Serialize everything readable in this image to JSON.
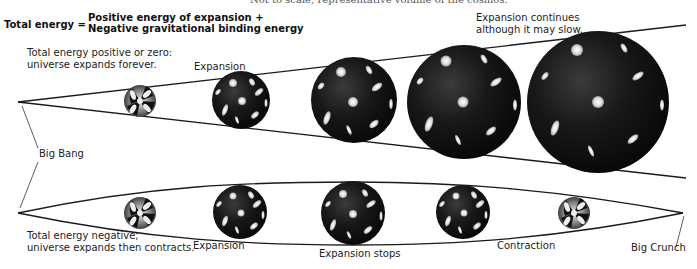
{
  "caption_fragment": "Not to scale; representative volume of the cosmos.",
  "equation": {
    "lhs": "Total energy =",
    "rhs_line1": "Positive energy of expansion +",
    "rhs_line2": "Negative gravitational binding energy"
  },
  "top_scenario": {
    "description_line1": "Total energy positive or zero:",
    "description_line2": "universe expands forever.",
    "stage_labels": {
      "expansion": "Expansion",
      "continues_line1": "Expansion continues",
      "continues_line2": "although it may slow."
    },
    "spheres": [
      {
        "cx": 140,
        "cy": 101,
        "r": 16,
        "style": "early"
      },
      {
        "cx": 241,
        "cy": 100,
        "r": 29,
        "style": "dark"
      },
      {
        "cx": 354,
        "cy": 100,
        "r": 43,
        "style": "dark"
      },
      {
        "cx": 464,
        "cy": 102,
        "r": 57,
        "style": "dark"
      },
      {
        "cx": 598,
        "cy": 102,
        "r": 71,
        "style": "dark"
      }
    ]
  },
  "bottom_scenario": {
    "description_line1": "Total energy negative;",
    "description_line2": "universe expands then contracts.",
    "stage_labels": {
      "expansion": "Expansion",
      "expansion_stops": "Expansion stops",
      "contraction": "Contraction",
      "big_crunch": "Big Crunch"
    },
    "spheres": [
      {
        "cx": 140,
        "cy": 213,
        "r": 16,
        "style": "early"
      },
      {
        "cx": 240,
        "cy": 212,
        "r": 27,
        "style": "dark"
      },
      {
        "cx": 353,
        "cy": 213,
        "r": 32,
        "style": "dark"
      },
      {
        "cx": 463,
        "cy": 212,
        "r": 27,
        "style": "dark"
      },
      {
        "cx": 574,
        "cy": 213,
        "r": 16,
        "style": "early"
      }
    ]
  },
  "big_bang_label": "Big Bang",
  "colors": {
    "line": "#1a1a1a",
    "sphere_dark": "#0d0d0d",
    "sphere_highlight": "#3a3a3a",
    "galaxy": "#e8e8e8",
    "background": "#ffffff"
  }
}
